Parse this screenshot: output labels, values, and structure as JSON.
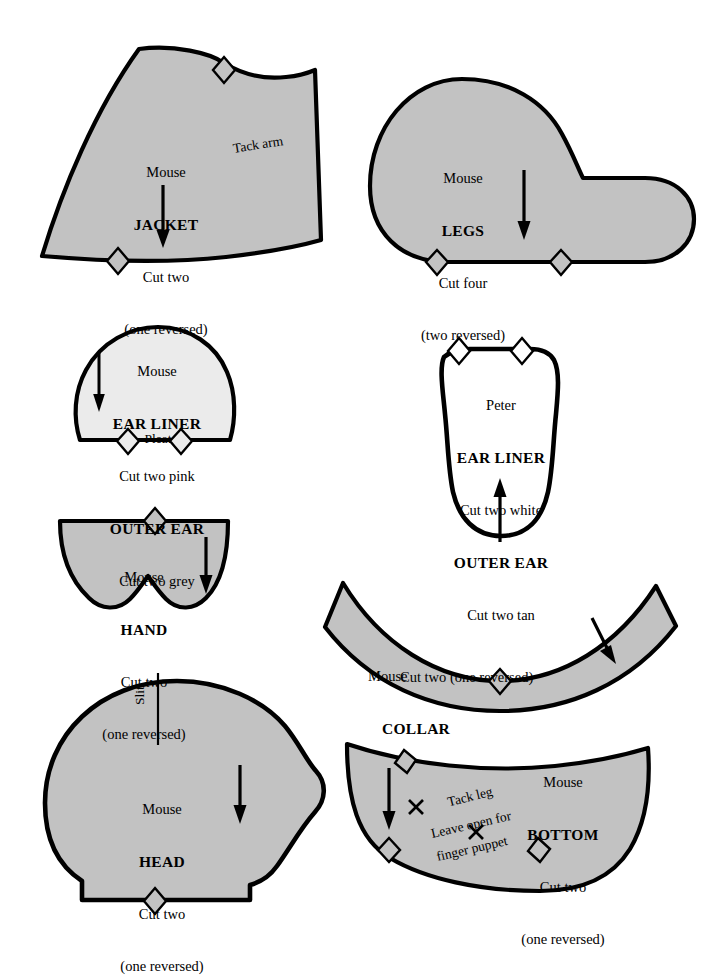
{
  "document": {
    "type": "sewing-pattern-sheet",
    "title": "Mouse and Peter Puppet Pattern Pieces",
    "piece_count": 8
  },
  "style": {
    "fill_grey": "#c2c2c2",
    "fill_light": "#ebebeb",
    "fill_white": "#ffffff",
    "outline": "#000000",
    "background": "#ffffff"
  },
  "pieces": [
    {
      "id": "jacket",
      "owner": "Mouse",
      "part": "JACKET",
      "cut": "Cut two",
      "note": "(one reversed)",
      "extra_label": "Tack arm",
      "fill": "grey",
      "grain_arrow": "down",
      "notches": 2
    },
    {
      "id": "legs",
      "owner": "Mouse",
      "part": "LEGS",
      "cut": "Cut four",
      "note": "(two reversed)",
      "fill": "grey",
      "grain_arrow": "down",
      "notches": 2
    },
    {
      "id": "mouse-ear",
      "owner": "Mouse",
      "part": "EAR LINER",
      "cut": "Cut two pink",
      "part2": "OUTER EAR",
      "cut2": "Cut two grey",
      "extra_label": "Pleat",
      "fill": "light",
      "grain_arrow": "down",
      "notches": 2
    },
    {
      "id": "peter-ear",
      "owner": "Peter",
      "part": "EAR LINER",
      "cut": "Cut two white",
      "part2": "OUTER EAR",
      "cut2": "Cut two tan",
      "fill": "white",
      "grain_arrow": "up",
      "notches": 2
    },
    {
      "id": "hand",
      "owner": "Mouse",
      "part": "HAND",
      "cut": "Cut two",
      "note": "(one reversed)",
      "fill": "grey",
      "grain_arrow": "down",
      "notches": 1
    },
    {
      "id": "collar",
      "owner": "Mouse",
      "part": "COLLAR",
      "cut": "Cut two (one reversed)",
      "fill": "grey",
      "grain_arrow": "diagonal-down-right",
      "notches": 1
    },
    {
      "id": "head",
      "owner": "Mouse",
      "part": "HEAD",
      "cut": "Cut two",
      "note": "(one reversed)",
      "extra_label": "Slit",
      "fill": "grey",
      "grain_arrow": "down",
      "notches": 1
    },
    {
      "id": "bottom",
      "owner": "Mouse",
      "part": "BOTTOM",
      "cut": "Cut two",
      "note": "(one reversed)",
      "mark1": "Tack leg",
      "mark2a": "Leave open for",
      "mark2b": "finger puppet",
      "fill": "grey",
      "grain_arrow": "down",
      "notches": 3,
      "cross_marks": 2
    }
  ]
}
